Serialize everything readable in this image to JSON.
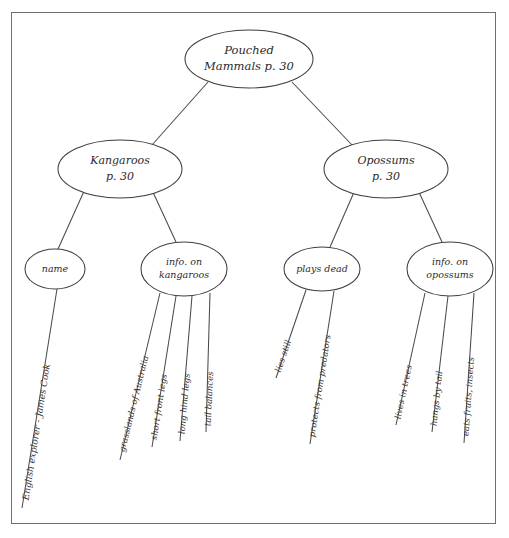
{
  "diagram": {
    "type": "concept-map",
    "title_node": "root",
    "style": {
      "background": "#ffffff",
      "frame_color": "#6f6f6f",
      "node_stroke": "#3f3f3f",
      "edge_color": "#4a4a4a",
      "text_color": "#2b2b2b"
    },
    "nodes": [
      {
        "id": "root",
        "label_lines": [
          "Pouched",
          "Mammals p. 30"
        ],
        "cx": 249,
        "cy": 59,
        "rx": 64,
        "ry": 29,
        "font_size": 11.5
      },
      {
        "id": "kangaroos",
        "label_lines": [
          "Kangaroos",
          "p. 30"
        ],
        "cx": 120,
        "cy": 169,
        "rx": 62,
        "ry": 29,
        "font_size": 11.0
      },
      {
        "id": "opossums",
        "label_lines": [
          "Opossums",
          "p. 30"
        ],
        "cx": 386,
        "cy": 169,
        "rx": 62,
        "ry": 29,
        "font_size": 11.0
      },
      {
        "id": "name",
        "label_lines": [
          "name"
        ],
        "cx": 55,
        "cy": 269,
        "rx": 30,
        "ry": 20,
        "font_size": 9.5
      },
      {
        "id": "info-kangaroos",
        "label_lines": [
          "info. on",
          "kangaroos"
        ],
        "cx": 184,
        "cy": 269,
        "rx": 43,
        "ry": 27,
        "font_size": 9.5
      },
      {
        "id": "plays-dead",
        "label_lines": [
          "plays dead"
        ],
        "cx": 322,
        "cy": 269,
        "rx": 38,
        "ry": 22,
        "font_size": 9.5
      },
      {
        "id": "info-opossums",
        "label_lines": [
          "info. on",
          "opossums"
        ],
        "cx": 450,
        "cy": 269,
        "rx": 43,
        "ry": 27,
        "font_size": 9.5
      }
    ],
    "edges": [
      {
        "from": "root",
        "to": "kangaroos",
        "x1": 208,
        "y1": 82,
        "x2": 152,
        "y2": 145
      },
      {
        "from": "root",
        "to": "opossums",
        "x1": 292,
        "y1": 82,
        "x2": 352,
        "y2": 145
      },
      {
        "from": "kangaroos",
        "to": "name",
        "x1": 85,
        "y1": 189,
        "x2": 58,
        "y2": 249
      },
      {
        "from": "kangaroos",
        "to": "info-kangaroos",
        "x1": 152,
        "y1": 190,
        "x2": 176,
        "y2": 242
      },
      {
        "from": "opossums",
        "to": "plays-dead",
        "x1": 355,
        "y1": 190,
        "x2": 330,
        "y2": 247
      },
      {
        "from": "opossums",
        "to": "info-opossums",
        "x1": 418,
        "y1": 190,
        "x2": 442,
        "y2": 242
      }
    ],
    "leaves": [
      {
        "id": "leaf-english-explorer",
        "parent": "name",
        "label": "English explorer - James Cook",
        "x1": 57,
        "y1": 289,
        "x2": 22,
        "y2": 508,
        "rotation": -81,
        "font_size": 9.0,
        "tx": 26,
        "ty": 500
      },
      {
        "id": "leaf-grasslands",
        "parent": "info-kangaroos",
        "label": "grasslands of Australia",
        "x1": 160,
        "y1": 293,
        "x2": 120,
        "y2": 460,
        "rotation": -76,
        "font_size": 8.5,
        "tx": 122,
        "ty": 452
      },
      {
        "id": "leaf-short-front-legs",
        "parent": "info-kangaroos",
        "label": "short front legs",
        "x1": 176,
        "y1": 296,
        "x2": 152,
        "y2": 447,
        "rotation": -81,
        "font_size": 8.5,
        "tx": 154,
        "ty": 440
      },
      {
        "id": "leaf-long-hind-legs",
        "parent": "info-kangaroos",
        "label": "long hind legs",
        "x1": 192,
        "y1": 296,
        "x2": 180,
        "y2": 441,
        "rotation": -85,
        "font_size": 8.5,
        "tx": 182,
        "ty": 434
      },
      {
        "id": "leaf-tail-balances",
        "parent": "info-kangaroos",
        "label": "tail balances",
        "x1": 210,
        "y1": 293,
        "x2": 206,
        "y2": 432,
        "rotation": -87,
        "font_size": 8.5,
        "tx": 208,
        "ty": 426
      },
      {
        "id": "leaf-lies-still",
        "parent": "plays-dead",
        "label": "lies still",
        "x1": 306,
        "y1": 290,
        "x2": 276,
        "y2": 378,
        "rotation": -71,
        "font_size": 8.5,
        "tx": 278,
        "ty": 372
      },
      {
        "id": "leaf-protects",
        "parent": "plays-dead",
        "label": "protects from predators",
        "x1": 334,
        "y1": 291,
        "x2": 310,
        "y2": 444,
        "rotation": -81,
        "font_size": 8.5,
        "tx": 312,
        "ty": 437
      },
      {
        "id": "leaf-lives-in-trees",
        "parent": "info-opossums",
        "label": "lives in trees",
        "x1": 425,
        "y1": 293,
        "x2": 396,
        "y2": 425,
        "rotation": -78,
        "font_size": 8.5,
        "tx": 398,
        "ty": 419
      },
      {
        "id": "leaf-hangs-by-tail",
        "parent": "info-opossums",
        "label": "hangs by tail",
        "x1": 448,
        "y1": 296,
        "x2": 432,
        "y2": 432,
        "rotation": -84,
        "font_size": 8.5,
        "tx": 434,
        "ty": 426
      },
      {
        "id": "leaf-eats-fruits",
        "parent": "info-opossums",
        "label": "eats fruits, insects",
        "x1": 474,
        "y1": 293,
        "x2": 464,
        "y2": 443,
        "rotation": -86,
        "font_size": 8.5,
        "tx": 466,
        "ty": 436
      }
    ]
  }
}
